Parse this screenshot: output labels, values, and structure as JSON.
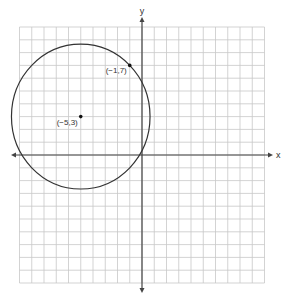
{
  "chart_data": {
    "type": "scatter",
    "title": "",
    "xlabel": "x",
    "ylabel": "y",
    "xlim": [
      -10,
      10
    ],
    "ylim": [
      -10,
      10
    ],
    "grid": true,
    "tick_labels_shown": false,
    "shapes": [
      {
        "kind": "circle",
        "center": [
          -5,
          3
        ],
        "radius_squared": 32,
        "passes_through": [
          -1,
          7
        ]
      }
    ],
    "points": [
      {
        "x": -5,
        "y": 3,
        "label": "(−5,3)"
      },
      {
        "x": -1,
        "y": 7,
        "label": "(−1,7)"
      }
    ]
  },
  "labels": {
    "x_axis": "x",
    "y_axis": "y",
    "center_point": "(−5,3)",
    "circle_point": "(−1,7)"
  },
  "colors": {
    "grid": "#c8c8c8",
    "axis": "#444444",
    "curve": "#333333",
    "point": "#111111"
  }
}
